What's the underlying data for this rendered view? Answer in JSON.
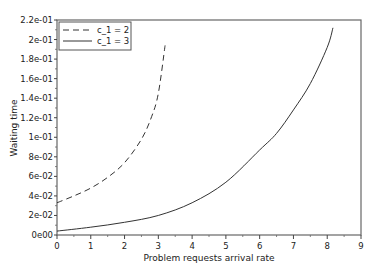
{
  "chart_data": {
    "type": "line",
    "title": "",
    "xlabel": "Problem requests arrival rate",
    "ylabel": "Waiting time",
    "xlim": [
      0,
      9
    ],
    "ylim": [
      0,
      0.22
    ],
    "x_ticks": [
      "0",
      "1",
      "2",
      "3",
      "4",
      "5",
      "6",
      "7",
      "8",
      "9"
    ],
    "y_ticks": [
      "0e00",
      "2e-02",
      "4e-02",
      "6e-02",
      "8e-02",
      "1e-01",
      "1.2e-01",
      "1.4e-01",
      "1.6e-01",
      "1.8e-01",
      "2e-01",
      "2.2e-01"
    ],
    "grid": false,
    "legend_position": "upper left",
    "series": [
      {
        "name": "c_1 = 2",
        "style": "dashed",
        "color": "#333333",
        "x": [
          0,
          0.5,
          1,
          1.5,
          2,
          2.5,
          2.8,
          3.0,
          3.2
        ],
        "values": [
          0.033,
          0.04,
          0.048,
          0.059,
          0.074,
          0.098,
          0.121,
          0.145,
          0.194
        ]
      },
      {
        "name": "c_1 = 3",
        "style": "solid",
        "color": "#333333",
        "x": [
          0,
          1,
          2,
          3,
          4,
          5,
          6,
          6.5,
          7,
          7.5,
          8,
          8.17
        ],
        "values": [
          0.004,
          0.008,
          0.013,
          0.02,
          0.033,
          0.054,
          0.087,
          0.104,
          0.128,
          0.155,
          0.192,
          0.212
        ]
      }
    ]
  }
}
